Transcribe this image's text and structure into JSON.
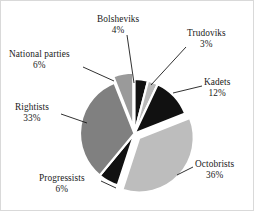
{
  "chart_data": {
    "type": "pie",
    "title": "",
    "subtitle": "",
    "xlabel": "",
    "ylabel": "",
    "legend_position": "none",
    "grid": false,
    "units": "percent",
    "categories": [
      "Bolsheviks",
      "Trudoviks",
      "Kadets",
      "Octobrists",
      "Progressists",
      "Rightists",
      "National parties"
    ],
    "values": [
      4,
      3,
      12,
      36,
      6,
      33,
      6
    ],
    "slices": [
      {
        "label": "Bolsheviks",
        "value": 4,
        "value_text": "4%",
        "color": "#111111",
        "exploded": false,
        "start_angle_deg": 0,
        "end_angle_deg": 14.4
      },
      {
        "label": "Trudoviks",
        "value": 3,
        "value_text": "3%",
        "color": "#b9b9b9",
        "exploded": false,
        "start_angle_deg": 14.4,
        "end_angle_deg": 25.2
      },
      {
        "label": "Kadets",
        "value": 12,
        "value_text": "12%",
        "color": "#111111",
        "exploded": false,
        "start_angle_deg": 25.2,
        "end_angle_deg": 68.4
      },
      {
        "label": "Octobrists",
        "value": 36,
        "value_text": "36%",
        "color": "#bdbdbd",
        "exploded": true,
        "start_angle_deg": 68.4,
        "end_angle_deg": 198.0
      },
      {
        "label": "Progressists",
        "value": 6,
        "value_text": "6%",
        "color": "#111111",
        "exploded": false,
        "start_angle_deg": 198.0,
        "end_angle_deg": 219.6
      },
      {
        "label": "Rightists",
        "value": 33,
        "value_text": "33%",
        "color": "#808080",
        "exploded": false,
        "start_angle_deg": 219.6,
        "end_angle_deg": 338.4
      },
      {
        "label": "National parties",
        "value": 6,
        "value_text": "6%",
        "color": "#9a9a9a",
        "exploded": true,
        "start_angle_deg": 338.4,
        "end_angle_deg": 360.0
      }
    ]
  },
  "labels": {
    "bolsheviks": {
      "name": "Bolsheviks",
      "pct": "4%"
    },
    "trudoviks": {
      "name": "Trudoviks",
      "pct": "3%"
    },
    "kadets": {
      "name": "Kadets",
      "pct": "12%"
    },
    "octobrists": {
      "name": "Octobrists",
      "pct": "36%"
    },
    "progressists": {
      "name": "Progressists",
      "pct": "6%"
    },
    "rightists": {
      "name": "Rightists",
      "pct": "33%"
    },
    "national_parties": {
      "name": "National parties",
      "pct": "6%"
    }
  },
  "colors": {
    "black": "#111111",
    "dark_gray": "#808080",
    "mid_gray": "#9a9a9a",
    "light_gray": "#bdbdbd",
    "pale_gray": "#b9b9b9",
    "background": "#ffffff",
    "leader_line": "#1a1a1a",
    "frame": "#d9d9d9"
  }
}
